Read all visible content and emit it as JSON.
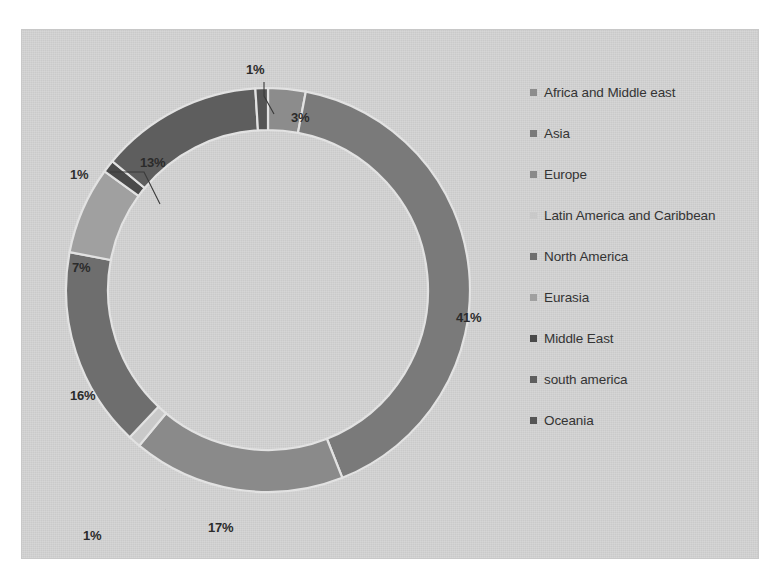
{
  "panel": {
    "background_color": "#d2d2d2",
    "page_background": "#ffffff"
  },
  "chart_data": {
    "type": "pie",
    "variant": "donut",
    "title": "",
    "subtitle": "",
    "xlabel": "",
    "ylabel": "",
    "grid": false,
    "legend_position": "right",
    "data_labels": "percent",
    "total": 100,
    "categories": [
      "Africa and Middle east",
      "Asia",
      "Europe",
      "Latin America and Caribbean",
      "North America",
      "Eurasia",
      "Middle East",
      "south america",
      "Oceania"
    ],
    "values": [
      3,
      41,
      17,
      1,
      16,
      7,
      1,
      13,
      1
    ],
    "labels": [
      "3%",
      "41%",
      "17%",
      "1%",
      "16%",
      "7%",
      "1%",
      "13%",
      "1%"
    ],
    "colors": [
      "#8c8c8c",
      "#7a7a7a",
      "#8a8a8a",
      "#c9c9c9",
      "#6e6e6e",
      "#a0a0a0",
      "#4a4a4a",
      "#5e5e5e",
      "#555555"
    ],
    "slices": [
      {
        "label": "Africa and Middle east",
        "value": 3,
        "percent_label": "3%",
        "color": "#8c8c8c"
      },
      {
        "label": "Asia",
        "value": 41,
        "percent_label": "41%",
        "color": "#7a7a7a"
      },
      {
        "label": "Europe",
        "value": 17,
        "percent_label": "17%",
        "color": "#8a8a8a"
      },
      {
        "label": "Latin America and Caribbean",
        "value": 1,
        "percent_label": "1%",
        "color": "#c9c9c9"
      },
      {
        "label": "North America",
        "value": 16,
        "percent_label": "16%",
        "color": "#6e6e6e"
      },
      {
        "label": "Eurasia",
        "value": 7,
        "percent_label": "7%",
        "color": "#a0a0a0"
      },
      {
        "label": "Middle East",
        "value": 1,
        "percent_label": "1%",
        "color": "#4a4a4a"
      },
      {
        "label": "south america",
        "value": 13,
        "percent_label": "13%",
        "color": "#5e5e5e"
      },
      {
        "label": "Oceania",
        "value": 1,
        "percent_label": "1%",
        "color": "#555555"
      }
    ]
  },
  "labels": {
    "top_small": "1%",
    "top_three": "3%",
    "right_large": "41%",
    "bottom": "17%",
    "bottom_left_small": "1%",
    "left_sixteen": "16%",
    "left_seven": "7%",
    "left_small": "1%",
    "upper_left_thirteen": "13%"
  },
  "legend": {
    "items": [
      {
        "label": "Africa and Middle east",
        "color": "#8c8c8c"
      },
      {
        "label": "Asia",
        "color": "#7a7a7a"
      },
      {
        "label": "Europe",
        "color": "#8a8a8a"
      },
      {
        "label": "Latin America and Caribbean",
        "color": "#c9c9c9"
      },
      {
        "label": "North America",
        "color": "#6e6e6e"
      },
      {
        "label": "Eurasia",
        "color": "#a0a0a0"
      },
      {
        "label": "Middle East",
        "color": "#4a4a4a"
      },
      {
        "label": "south america",
        "color": "#5e5e5e"
      },
      {
        "label": "Oceania",
        "color": "#555555"
      }
    ]
  }
}
